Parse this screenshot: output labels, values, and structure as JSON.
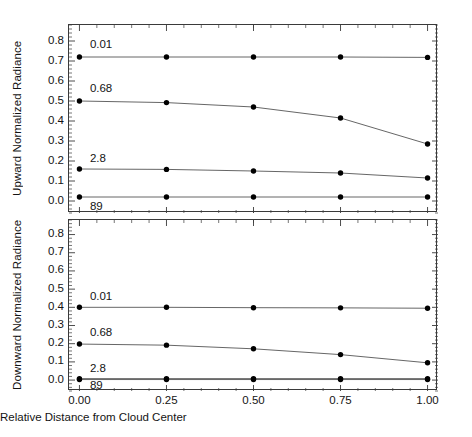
{
  "figure": {
    "width": 472,
    "height": 437,
    "background": "#ffffff",
    "line_color": "#555555",
    "marker_color": "#000000",
    "axis_color": "#3a3a3a"
  },
  "chart_data": [
    {
      "type": "line",
      "panel": "top",
      "title": "",
      "xlabel": "",
      "ylabel": "Upward Normalized Radiance",
      "x": [
        0.0,
        0.25,
        0.5,
        0.75,
        1.0
      ],
      "xticklabels": [
        "0.00",
        "0.25",
        "0.50",
        "0.75",
        "1.00"
      ],
      "xlim": [
        -0.03,
        1.03
      ],
      "ylim": [
        -0.06,
        0.88
      ],
      "yticks": [
        0.0,
        0.1,
        0.2,
        0.3,
        0.4,
        0.5,
        0.6,
        0.7,
        0.8
      ],
      "yticklabels": [
        "0.0",
        "0.1",
        "0.2",
        "0.3",
        "0.4",
        "0.5",
        "0.6",
        "0.7",
        "0.8"
      ],
      "grid": false,
      "legend": "inline-labels",
      "series": [
        {
          "name": "0.01",
          "values": [
            0.72,
            0.72,
            0.72,
            0.72,
            0.718
          ]
        },
        {
          "name": "0.68",
          "values": [
            0.5,
            0.492,
            0.47,
            0.415,
            0.285
          ]
        },
        {
          "name": "2.8",
          "values": [
            0.16,
            0.158,
            0.15,
            0.14,
            0.115
          ]
        },
        {
          "name": "89",
          "values": [
            0.02,
            0.02,
            0.02,
            0.02,
            0.02
          ]
        }
      ]
    },
    {
      "type": "line",
      "panel": "bottom",
      "title": "",
      "xlabel": "Relative Distance from Cloud Center",
      "ylabel": "Downward Normalized Radiance",
      "x": [
        0.0,
        0.25,
        0.5,
        0.75,
        1.0
      ],
      "xticklabels": [
        "0.00",
        "0.25",
        "0.50",
        "0.75",
        "1.00"
      ],
      "xlim": [
        -0.03,
        1.03
      ],
      "ylim": [
        -0.06,
        0.88
      ],
      "yticks": [
        0.0,
        0.1,
        0.2,
        0.3,
        0.4,
        0.5,
        0.6,
        0.7,
        0.8
      ],
      "yticklabels": [
        "0.0",
        "0.1",
        "0.2",
        "0.3",
        "0.4",
        "0.5",
        "0.6",
        "0.7",
        "0.8"
      ],
      "grid": false,
      "legend": "inline-labels",
      "series": [
        {
          "name": "0.01",
          "values": [
            0.4,
            0.4,
            0.398,
            0.397,
            0.395
          ]
        },
        {
          "name": "0.68",
          "values": [
            0.198,
            0.192,
            0.172,
            0.14,
            0.095
          ]
        },
        {
          "name": "2.8",
          "values": [
            0.008,
            0.008,
            0.008,
            0.008,
            0.008
          ]
        },
        {
          "name": "89",
          "values": [
            0.003,
            0.003,
            0.003,
            0.003,
            0.003
          ]
        }
      ]
    }
  ],
  "top_panel": {
    "ylabel": "Upward Normalized Radiance",
    "series_labels": [
      {
        "text": "0.01",
        "x": 0.03,
        "y": 0.775
      },
      {
        "text": "0.68",
        "x": 0.03,
        "y": 0.553
      },
      {
        "text": "2.8",
        "x": 0.03,
        "y": 0.205
      },
      {
        "text": "89",
        "x": 0.03,
        "y": -0.033
      }
    ]
  },
  "bottom_panel": {
    "ylabel": "Downward Normalized Radiance",
    "series_labels": [
      {
        "text": "0.01",
        "x": 0.03,
        "y": 0.452
      },
      {
        "text": "0.68",
        "x": 0.03,
        "y": 0.252
      },
      {
        "text": "2.8",
        "x": 0.03,
        "y": 0.058
      },
      {
        "text": "89",
        "x": 0.03,
        "y": -0.04
      }
    ]
  },
  "xaxis": {
    "title": "Relative Distance from Cloud Center",
    "ticklabels": [
      "0.00",
      "0.25",
      "0.50",
      "0.75",
      "1.00"
    ]
  }
}
